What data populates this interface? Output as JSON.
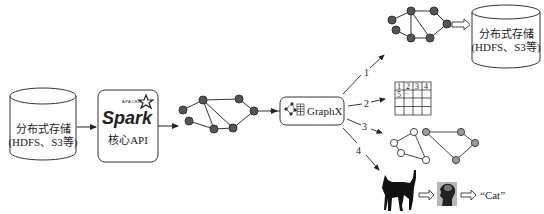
{
  "source_storage": {
    "line1": "分布式存储",
    "line2": "(HDFS、S3等)"
  },
  "spark_box": {
    "apache_label": "APACHE",
    "logo_text": "Spark",
    "subtitle": "核心API"
  },
  "graphx_box": {
    "label": "GraphX",
    "icon": "graph-table-icon"
  },
  "branches": [
    {
      "number": "1",
      "target": "graph written back to distributed storage"
    },
    {
      "number": "2",
      "target": "table"
    },
    {
      "number": "3",
      "target": "two-component graph"
    },
    {
      "number": "4",
      "target": "cat image recognition"
    }
  ],
  "target_storage": {
    "line1": "分布式存储",
    "line2": "(HDFS、S3等)"
  },
  "table": {
    "header": [
      "1",
      "2",
      "3",
      "4"
    ],
    "row2_first": "5",
    "row2_ellipsis": "···",
    "rows": 4,
    "cols": 4
  },
  "ml_pipeline": {
    "input_icon": "cat-silhouette-icon",
    "model_icon": "brain-head-icon",
    "output_label": "“Cat”"
  },
  "colors": {
    "node_fill": "#555555",
    "node_fill_light": "#ffffff",
    "node_fill_gray": "#9a9a9a",
    "edge": "#333333",
    "box_stroke": "#333333"
  }
}
